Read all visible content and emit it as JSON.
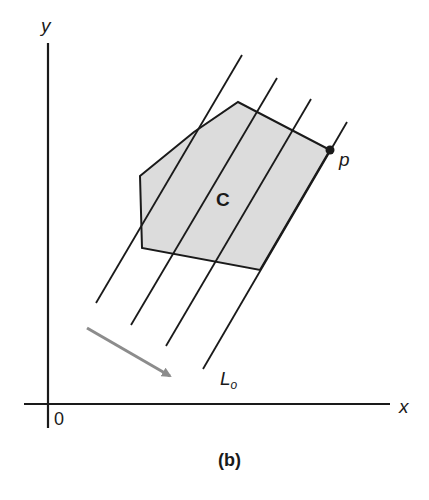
{
  "figure": {
    "caption": "(b)",
    "axes": {
      "y_label": "y",
      "x_label": "x",
      "origin_label": "0"
    },
    "region": {
      "label": "C",
      "fill_color": "#dcdcdc",
      "vertices": [
        [
          140,
          176
        ],
        [
          194,
          132
        ],
        [
          238,
          102
        ],
        [
          330,
          150
        ],
        [
          260,
          270
        ],
        [
          142,
          248
        ]
      ]
    },
    "point": {
      "label": "p",
      "x": 330,
      "y": 150
    },
    "line_label": {
      "main": "L",
      "subscript": "o"
    },
    "parallel_lines": [
      {
        "x1": 96,
        "y1": 303,
        "x2": 242,
        "y2": 55
      },
      {
        "x1": 131,
        "y1": 325,
        "x2": 277,
        "y2": 78
      },
      {
        "x1": 166,
        "y1": 346,
        "x2": 311,
        "y2": 99
      },
      {
        "x1": 203,
        "y1": 369,
        "x2": 347,
        "y2": 122
      }
    ],
    "arrow": {
      "color": "#8c8c8c",
      "x1": 87,
      "y1": 328,
      "x2": 173,
      "y2": 378
    },
    "colors": {
      "stroke": "#1a1a1a",
      "background": "#ffffff"
    }
  }
}
